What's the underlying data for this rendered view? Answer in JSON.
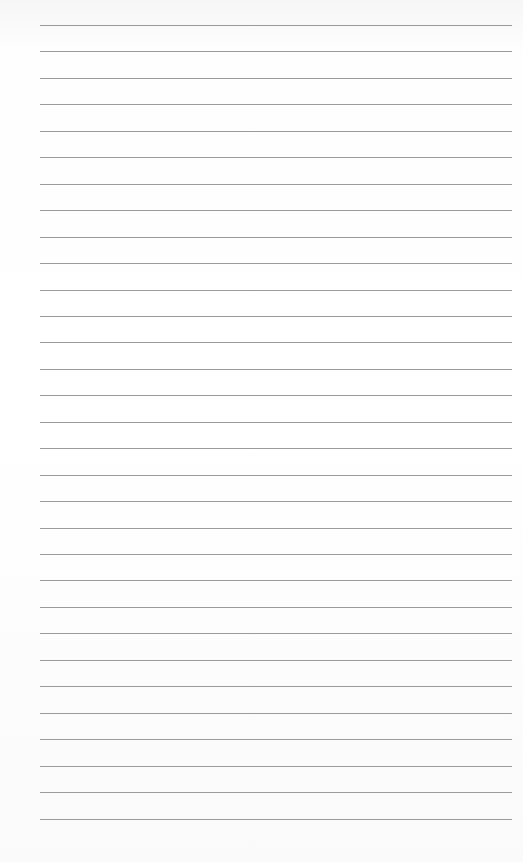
{
  "page": {
    "type": "lined-paper",
    "background_color": "#ffffff",
    "rule_color": "#8a8a8a",
    "rule_left": 40,
    "rule_right": 512,
    "first_rule_y": 25,
    "rule_spacing": 26.45,
    "rule_count": 31
  }
}
